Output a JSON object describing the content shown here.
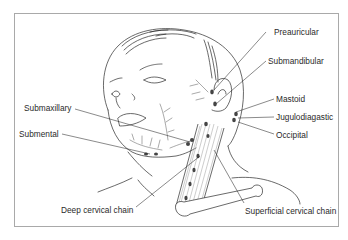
{
  "diagram": {
    "labels": {
      "preauricular": "Preauricular",
      "submandibular": "Submandibular",
      "mastoid": "Mastoid",
      "jugulodiagastic": "Jugulodiagastic",
      "occipital": "Occipital",
      "submaxillary": "Submaxillary",
      "submental": "Submental",
      "deep_cervical": "Deep cervical chain",
      "superficial_cervical": "Superficial cervical chain"
    },
    "colors": {
      "line": "#2a2a2a",
      "border": "#a9a9a9",
      "node": "#444444",
      "muscle": "#9a9a9a"
    }
  }
}
